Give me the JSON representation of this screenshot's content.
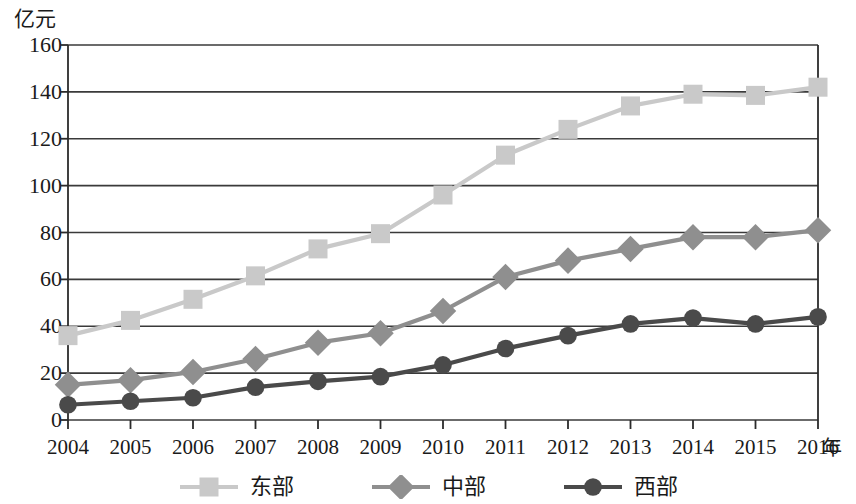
{
  "chart_data": {
    "type": "line",
    "title": "",
    "xlabel": "年",
    "ylabel": "亿元",
    "xlim": [
      2004,
      2016
    ],
    "ylim": [
      0,
      160
    ],
    "y_tick_step": 20,
    "grid": true,
    "legend_position": "bottom",
    "categories": [
      "2004",
      "2005",
      "2006",
      "2007",
      "2008",
      "2009",
      "2010",
      "2011",
      "2012",
      "2013",
      "2014",
      "2015",
      "2016"
    ],
    "y_tick_labels": [
      "0",
      "20",
      "40",
      "60",
      "80",
      "100",
      "120",
      "140",
      "160"
    ],
    "series": [
      {
        "name": "东部",
        "marker": "square",
        "color": "#c9c9c9",
        "line_color": "#c9c9c9",
        "values": [
          36,
          42.5,
          51.5,
          61.5,
          73,
          79.5,
          96,
          113,
          124,
          134,
          139,
          138.5,
          142
        ]
      },
      {
        "name": "中部",
        "marker": "diamond",
        "color": "#8f8f8f",
        "line_color": "#8f8f8f",
        "values": [
          15,
          17,
          20.5,
          26,
          33,
          37,
          46.5,
          61,
          68,
          73,
          78,
          78,
          81
        ]
      },
      {
        "name": "西部",
        "marker": "circle",
        "color": "#4a4a4a",
        "line_color": "#4a4a4a",
        "values": [
          6.5,
          8,
          9.5,
          14,
          16.5,
          18.5,
          23.5,
          30.5,
          36,
          41,
          43.5,
          41,
          44
        ]
      }
    ]
  },
  "legend": {
    "items": [
      {
        "label": "东部",
        "marker": "square-marker",
        "color": "#c9c9c9"
      },
      {
        "label": "中部",
        "marker": "diamond-marker",
        "color": "#8f8f8f"
      },
      {
        "label": "西部",
        "marker": "circle-marker",
        "color": "#4a4a4a"
      }
    ]
  },
  "axes": {
    "y_unit": "亿元",
    "x_unit": "年",
    "frame_color": "#2b2b2b",
    "grid_color": "#3a3a3a"
  }
}
